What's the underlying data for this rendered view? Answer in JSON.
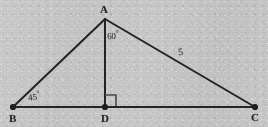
{
  "figure": {
    "kind": "geometry-diagram",
    "shape": "triangle-with-altitude",
    "background_color": "#c9c9c9",
    "stroke_color": "#232329",
    "canvas": {
      "width": 268,
      "height": 127
    }
  },
  "vertices": [
    {
      "id": "A",
      "label": "A",
      "x": 105,
      "y": 19,
      "has_dot": false,
      "label_x": 100,
      "label_y": 4
    },
    {
      "id": "B",
      "label": "B",
      "x": 13,
      "y": 107,
      "has_dot": true,
      "label_x": 9,
      "label_y": 113
    },
    {
      "id": "D",
      "label": "D",
      "x": 105,
      "y": 107,
      "has_dot": true,
      "label_x": 101,
      "label_y": 113
    },
    {
      "id": "C",
      "label": "C",
      "x": 255,
      "y": 107,
      "has_dot": true,
      "label_x": 251,
      "label_y": 112
    }
  ],
  "segments": [
    {
      "id": "BA",
      "from": "B",
      "to": "A",
      "x1": 13,
      "y1": 107,
      "x2": 105,
      "y2": 19
    },
    {
      "id": "AC",
      "from": "A",
      "to": "C",
      "x1": 105,
      "y1": 19,
      "x2": 255,
      "y2": 107
    },
    {
      "id": "BC",
      "from": "B",
      "to": "C",
      "x1": 13,
      "y1": 107,
      "x2": 255,
      "y2": 107
    },
    {
      "id": "AD",
      "from": "A",
      "to": "D",
      "x1": 105,
      "y1": 19,
      "x2": 105,
      "y2": 107
    }
  ],
  "angles": [
    {
      "id": "angle-B",
      "at_vertex": "B",
      "value": "45",
      "degree_symbol": "°",
      "label_x": 28,
      "label_y": 91
    },
    {
      "id": "angle-A",
      "at_vertex": "A",
      "value": "60",
      "degree_symbol": "°",
      "label_x": 107,
      "label_y": 30
    },
    {
      "id": "angle-D",
      "at_vertex": "D",
      "value": "90",
      "marker": "right-angle-square",
      "square_x": 105,
      "square_y": 95,
      "square_size": 11
    }
  ],
  "side_labels": [
    {
      "id": "side-AC",
      "on_segment": "AC",
      "text": "5",
      "label_x": 178,
      "label_y": 47
    }
  ]
}
